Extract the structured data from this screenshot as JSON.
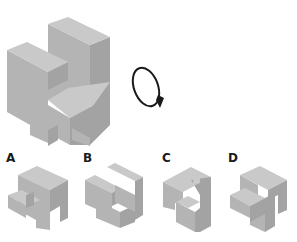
{
  "question": {
    "type": "mental-rotation-puzzle",
    "instruction_icon": "clockwise-rotation-arrow-icon"
  },
  "colors": {
    "top_face": "#c9c9c9",
    "left_face": "#b4b4b4",
    "right_face": "#a3a3a3",
    "arrow": "#1a1a1a",
    "background": "#ffffff"
  },
  "options": [
    {
      "label": "A"
    },
    {
      "label": "B"
    },
    {
      "label": "C"
    },
    {
      "label": "D"
    }
  ]
}
